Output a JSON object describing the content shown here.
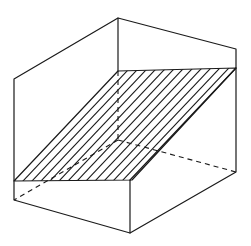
{
  "figure": {
    "stroke_color": "#1a1a1a",
    "background": "#ffffff",
    "vertices": {
      "top_left_back": [
        14,
        79
      ],
      "top_center_back": [
        118,
        18
      ],
      "top_right": [
        236,
        49
      ],
      "bottom_right": [
        236,
        172
      ],
      "bottom_front": [
        130,
        233
      ],
      "bottom_left": [
        14,
        200
      ],
      "hidden_back_corner": [
        118,
        140
      ],
      "front_mid": [
        130,
        180
      ]
    },
    "hatched_plane": {
      "corners": [
        [
          118,
          71
        ],
        [
          236,
          68
        ],
        [
          132,
          180
        ],
        [
          14,
          181
        ]
      ],
      "hatch_line_count": 12
    }
  }
}
